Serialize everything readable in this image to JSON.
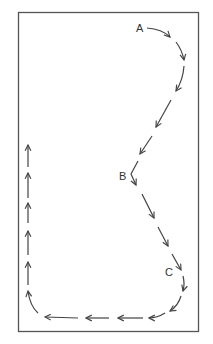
{
  "diagram": {
    "frame": {
      "x": 18,
      "y": 12,
      "w": 181,
      "h": 320,
      "stroke": "#555555"
    },
    "stroke_color": "#444444",
    "labels": [
      {
        "id": "A",
        "text": "A",
        "x": 136,
        "y": 32
      },
      {
        "id": "B",
        "text": "B",
        "x": 119,
        "y": 180
      },
      {
        "id": "C",
        "text": "C",
        "x": 165,
        "y": 276
      }
    ],
    "caption": ""
  }
}
